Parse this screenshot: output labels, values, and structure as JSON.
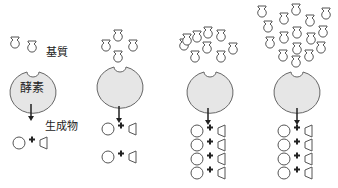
{
  "labels": {
    "substrate": "基質",
    "enzyme": "酵素",
    "product": "生成物"
  },
  "colors": {
    "enzyme_fill": "#e6e6e6",
    "stroke": "#555555",
    "arrow": "#222222"
  },
  "panels": [
    {
      "name": "low-substrate",
      "substrate_count": 2,
      "product_rows": 1
    },
    {
      "name": "medium-substrate",
      "substrate_count": 4,
      "product_rows": 2
    },
    {
      "name": "high-substrate",
      "substrate_count": 9,
      "product_rows": 4
    },
    {
      "name": "saturated-substrate",
      "substrate_count": 16,
      "product_rows": 4
    }
  ]
}
